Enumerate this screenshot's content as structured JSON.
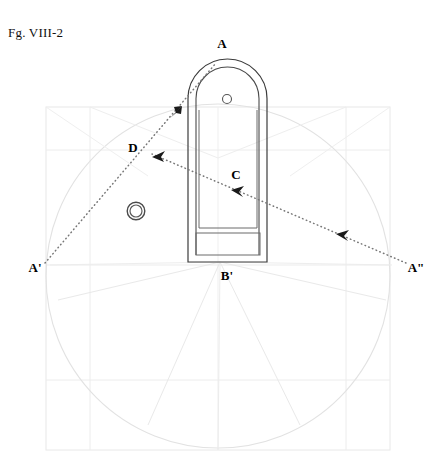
{
  "figure": {
    "caption": "Fg. VIII-2",
    "type": "technical-construction-drawing",
    "canvas": {
      "width": 440,
      "height": 458
    },
    "colors": {
      "ink": "#1a1a1a",
      "outline": "#3a3a3a",
      "construction": "#e3e3e3",
      "construction_strong": "#dcdcdc",
      "dotted": "#6a6a6a",
      "background": "#ffffff"
    }
  },
  "labels": [
    {
      "id": "A",
      "text": "A",
      "x": 222,
      "y": 44,
      "anchor": "middle"
    },
    {
      "id": "D",
      "text": "D",
      "x": 133,
      "y": 148,
      "anchor": "middle"
    },
    {
      "id": "C",
      "text": "C",
      "x": 236,
      "y": 175,
      "anchor": "middle"
    },
    {
      "id": "Ap",
      "text": "A'",
      "x": 35,
      "y": 268,
      "anchor": "middle"
    },
    {
      "id": "Bp",
      "text": "B'",
      "x": 227,
      "y": 276,
      "anchor": "middle"
    },
    {
      "id": "App",
      "text": "A\"",
      "x": 416,
      "y": 268,
      "anchor": "middle"
    }
  ],
  "object": {
    "name": "arched-case-front-view",
    "outer_arch": {
      "left": 188,
      "right": 267,
      "top": 59,
      "bottom": 262,
      "arch_radius": 39.5,
      "arch_center_y": 98.5
    },
    "inner_arch": {
      "left": 196,
      "right": 259,
      "top": 67,
      "bottom": 255,
      "arch_radius": 31.5,
      "arch_center_y": 98.5
    },
    "inner_panel": {
      "left": 199,
      "right": 257,
      "top": 110,
      "bottom": 228
    },
    "base_rect": {
      "left": 196,
      "right": 260,
      "top": 233,
      "bottom": 255
    },
    "dial_hole": {
      "cx": 227,
      "cy": 99,
      "r": 4.5
    },
    "ring": {
      "cx": 136,
      "cy": 211,
      "r_outer": 9,
      "r_inner": 6
    }
  },
  "construction": {
    "frame": {
      "left": 46,
      "right": 390,
      "top": 107,
      "bottom": 450
    },
    "circle": {
      "cx": 218,
      "cy": 276,
      "r": 172
    },
    "grid_lines_v": [
      46,
      90,
      218,
      346,
      390
    ],
    "grid_lines_h": [
      107,
      150,
      265,
      380,
      450
    ],
    "radiating_origin": {
      "x": 220,
      "y": 262
    }
  },
  "sight_lines": [
    {
      "id": "line-A-prime",
      "from": "A'",
      "to": "A",
      "x1": 45,
      "y1": 263,
      "x2": 216,
      "y2": 63,
      "style": "dotted"
    },
    {
      "id": "line-A-dblprime",
      "from": "A\"",
      "to": "D",
      "x1": 406,
      "y1": 263,
      "x2": 152,
      "y2": 154,
      "style": "dotted"
    }
  ],
  "arrowheads": [
    {
      "id": "arrow-toward-A",
      "x": 177,
      "y": 110,
      "dir": "up-right"
    },
    {
      "id": "arrow-toward-D",
      "x": 157,
      "y": 156,
      "dir": "down-left"
    },
    {
      "id": "arrow-toward-C",
      "x": 237,
      "y": 192,
      "dir": "down-left"
    },
    {
      "id": "arrow-toward-A2",
      "x": 342,
      "y": 236,
      "dir": "down-left"
    }
  ]
}
